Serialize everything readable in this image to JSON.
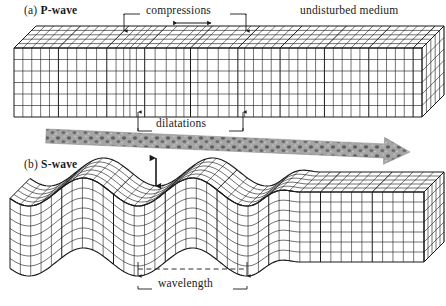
{
  "figure": {
    "title_a": "(a) P-wave",
    "title_b": "(b) S-wave",
    "background_color": "#ffffff",
    "ink_color": "#1a1a1a"
  },
  "panels": [
    {
      "id": "p-wave",
      "label_prefix": "(a)",
      "label_name": "P-wave",
      "description": "compressional wave grid block"
    },
    {
      "id": "s-wave",
      "label_prefix": "(b)",
      "label_name": "S-wave",
      "description": "shear wave grid block"
    }
  ],
  "labels": {
    "p_wave": "(a) P-wave",
    "p_wave_prefix": "(a)",
    "p_wave_bold": "P-wave",
    "s_wave": "(b) S-wave",
    "s_wave_prefix": "(b)",
    "s_wave_bold": "S-wave",
    "compressions": "compressions",
    "dilatations": "dilatations",
    "undisturbed_medium": "undisturbed medium",
    "wavelength": "wavelength"
  },
  "annotations": {
    "compressions": {
      "text": "compressions",
      "leader_left_x": 124,
      "leader_right_x": 246,
      "arrow_tip_y": 31,
      "double_arrow_left_x": 177,
      "double_arrow_right_x": 211,
      "double_arrow_y": 23
    },
    "dilatations": {
      "text": "dilatations",
      "leader_left_x": 138,
      "leader_right_x": 243,
      "arrow_tip_y": 112
    },
    "wavelength": {
      "text": "wavelength",
      "dashed_from_x": 138,
      "dashed_to_x": 247,
      "dashed_y": 269,
      "arrow_tip_y": 276
    },
    "amplitude_arrow": {
      "x": 156,
      "top_y": 158,
      "bottom_y": 186
    },
    "propagation_arrow": {
      "color": "#9a9a9a",
      "texture": "mottled-speckle",
      "from_x": 46,
      "from_y": 136,
      "to_x": 410,
      "to_y": 152
    }
  },
  "chart_data": {
    "type": "diagram",
    "p_wave": {
      "wave_type": "compressional",
      "particle_motion": "parallel to propagation",
      "features": [
        "compressions",
        "dilatations",
        "undisturbed medium"
      ],
      "compression_centers_x": [
        130,
        188,
        246
      ],
      "dilatation_centers_x": [
        159,
        217
      ],
      "grid_columns": 46,
      "grid_rows": 6
    },
    "s_wave": {
      "wave_type": "shear",
      "particle_motion": "perpendicular to propagation",
      "features": [
        "wavelength",
        "amplitude"
      ],
      "wavelength_px": 109,
      "amplitude_px": 14,
      "grid_columns": 40,
      "grid_rows": 7
    }
  },
  "icons": {
    "arrow_down": "arrow-down-icon",
    "arrow_up": "arrow-up-icon",
    "arrow_double_horizontal": "double-arrow-horizontal-icon",
    "arrow_double_vertical": "double-arrow-vertical-icon",
    "propagation_arrow": "propagation-arrow-icon"
  }
}
